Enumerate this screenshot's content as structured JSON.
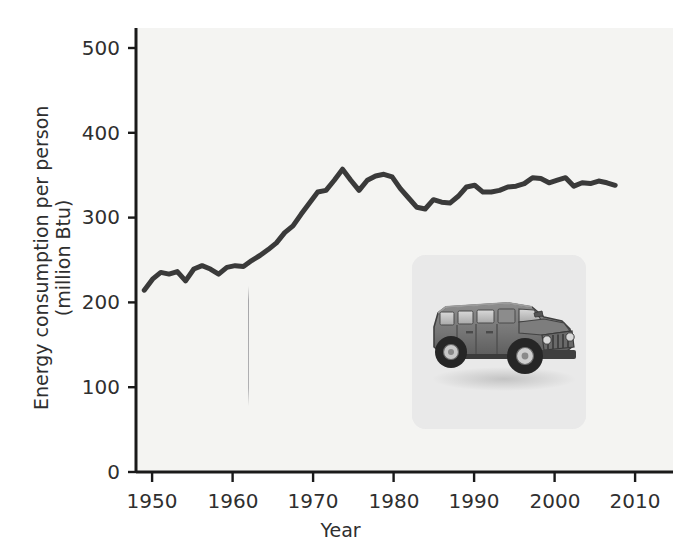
{
  "chart_data": {
    "type": "line",
    "title": "",
    "xlabel": "Year",
    "ylabel": "Energy consumption per person (million Btu)",
    "ylabel_line1": "Energy consumption per person",
    "ylabel_line2": "(million Btu)",
    "xlim": [
      1948,
      2013
    ],
    "ylim": [
      0,
      525
    ],
    "xticks": [
      1950,
      1960,
      1970,
      1980,
      1990,
      2000,
      2010
    ],
    "xtick_labels": [
      "1950",
      "1960",
      "1970",
      "1980",
      "1990",
      "2000",
      "2010"
    ],
    "yticks": [
      0,
      100,
      200,
      300,
      400,
      500
    ],
    "ytick_labels": [
      "0",
      "100",
      "200",
      "300",
      "400",
      "500"
    ],
    "grid": false,
    "legend": "none",
    "line_color": "#3a3a3a",
    "line_width": 5,
    "plot_background": "#f4f4f2",
    "axis_color": "#1a1a1a",
    "x": [
      1949,
      1950,
      1951,
      1952,
      1953,
      1954,
      1955,
      1956,
      1957,
      1958,
      1959,
      1960,
      1961,
      1962,
      1963,
      1964,
      1965,
      1966,
      1967,
      1968,
      1969,
      1970,
      1971,
      1972,
      1973,
      1974,
      1975,
      1976,
      1977,
      1978,
      1979,
      1980,
      1981,
      1982,
      1983,
      1984,
      1985,
      1986,
      1987,
      1988,
      1989,
      1990,
      1991,
      1992,
      1993,
      1994,
      1995,
      1996,
      1997,
      1998,
      1999,
      2000,
      2001,
      2002,
      2003,
      2004,
      2005,
      2006
    ],
    "y": [
      215,
      228,
      236,
      234,
      237,
      226,
      240,
      244,
      240,
      234,
      242,
      244,
      243,
      250,
      256,
      263,
      271,
      283,
      291,
      305,
      318,
      331,
      333,
      345,
      358,
      345,
      333,
      345,
      350,
      352,
      349,
      335,
      324,
      313,
      311,
      322,
      319,
      318,
      326,
      337,
      339,
      331,
      331,
      333,
      337,
      338,
      341,
      348,
      347,
      342,
      345,
      348,
      338,
      342,
      341,
      344,
      342,
      339
    ],
    "series_name": "Energy consumption per person (million Btu)",
    "units": "million Btu",
    "annotation_image": "hummer-suv-photo"
  },
  "figure": {
    "inset_caption": "",
    "inset_alt": "Hummer H1 sport utility vehicle photograph"
  }
}
